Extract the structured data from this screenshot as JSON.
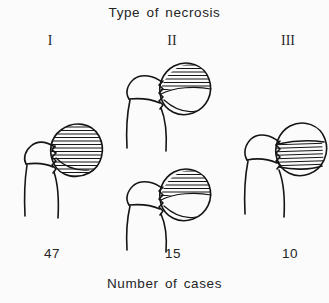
{
  "figure": {
    "title": "Type of necrosis",
    "footer": "Number of cases",
    "background_color": "#fbfbfb",
    "ink_color": "#151515"
  },
  "columns": [
    {
      "id": "type-1",
      "heading": "I",
      "count": "47",
      "drawings": [
        {
          "id": "femur-type-1",
          "necrosis_extent": "entire femoral head hatched",
          "hatch_orientation": "horizontal"
        }
      ]
    },
    {
      "id": "type-2",
      "heading": "II",
      "count": "15",
      "drawings": [
        {
          "id": "femur-type-2-upper",
          "necrosis_extent": "superior segment of femoral head hatched",
          "hatch_orientation": "horizontal"
        },
        {
          "id": "femur-type-2-lower",
          "necrosis_extent": "superior segment of femoral head hatched",
          "hatch_orientation": "horizontal"
        }
      ]
    },
    {
      "id": "type-3",
      "heading": "III",
      "count": "10",
      "drawings": [
        {
          "id": "femur-type-3",
          "necrosis_extent": "mid wedge band of femoral head hatched",
          "hatch_orientation": "horizontal"
        }
      ]
    }
  ]
}
